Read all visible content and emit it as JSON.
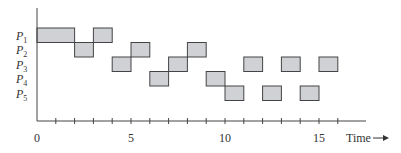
{
  "chart_data": {
    "type": "gantt",
    "title": "",
    "xlabel": "Time",
    "ylabel": "",
    "xlim": [
      0,
      17
    ],
    "x_ticks": [
      0,
      1,
      2,
      3,
      4,
      5,
      6,
      7,
      8,
      9,
      10,
      11,
      12,
      13,
      14,
      15,
      16
    ],
    "x_tick_labels": [
      {
        "value": 0,
        "label": "0"
      },
      {
        "value": 5,
        "label": "5"
      },
      {
        "value": 10,
        "label": "10"
      },
      {
        "value": 15,
        "label": "15"
      }
    ],
    "grid": false,
    "legend": null,
    "rows": [
      {
        "name": "P1",
        "sub": "1",
        "segments": [
          [
            0,
            2
          ],
          [
            3,
            4
          ]
        ]
      },
      {
        "name": "P2",
        "sub": "2",
        "segments": [
          [
            2,
            3
          ],
          [
            5,
            6
          ],
          [
            8,
            9
          ]
        ]
      },
      {
        "name": "P3",
        "sub": "3",
        "segments": [
          [
            4,
            5
          ],
          [
            7,
            8
          ],
          [
            11,
            12
          ],
          [
            13,
            14
          ],
          [
            15,
            16
          ]
        ]
      },
      {
        "name": "P4",
        "sub": "4",
        "segments": [
          [
            6,
            7
          ],
          [
            9,
            10
          ]
        ]
      },
      {
        "name": "P5",
        "sub": "5",
        "segments": [
          [
            10,
            11
          ],
          [
            12,
            13
          ],
          [
            14,
            15
          ]
        ]
      }
    ],
    "colors": {
      "bar_fill": "#cfd1d4",
      "bar_stroke": "#444444",
      "axis": "#444444"
    }
  },
  "axis_label": "Time",
  "axis_arrow": "→"
}
